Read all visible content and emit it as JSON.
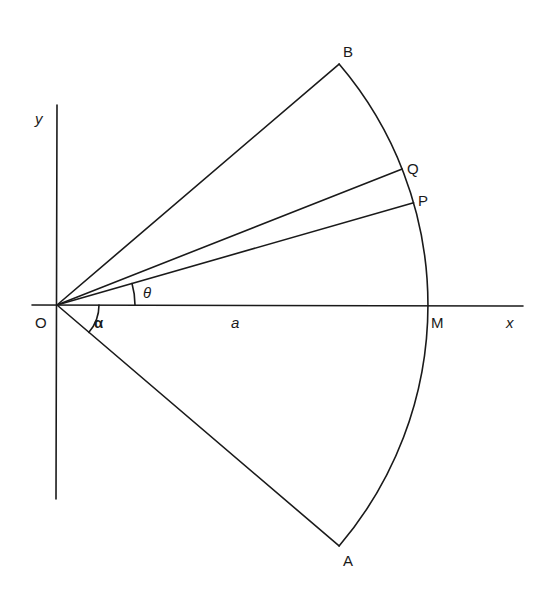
{
  "diagram": {
    "labels": {
      "origin": "O",
      "y_axis": "y",
      "x_axis": "x",
      "point_B": "B",
      "point_Q": "Q",
      "point_P": "P",
      "point_M": "M",
      "point_A": "A",
      "theta": "θ",
      "alpha": "α",
      "radius": "a"
    },
    "angles_deg": {
      "B": 40.5,
      "Q": 21.5,
      "P": 16,
      "M": 0,
      "A": -40.5,
      "theta_mark": 16,
      "alpha_mark": -40.5
    },
    "colors": {
      "stroke": "#1a1a1a",
      "background": "#ffffff"
    }
  }
}
